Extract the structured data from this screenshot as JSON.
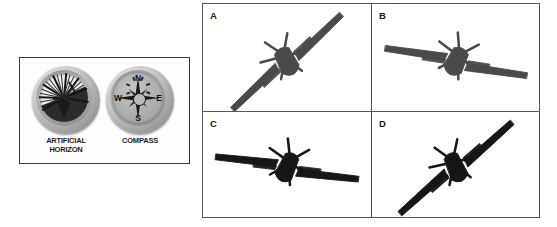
{
  "figure": {
    "type": "aviation-instruments-and-aircraft-attitude-figure",
    "background_color": "#ffffff"
  },
  "instrument_panel": {
    "border_color": "#3a3a3a",
    "instruments": [
      {
        "id": "artificial-horizon",
        "caption_line1": "ARTIFICIAL",
        "caption_line2": "HORIZON",
        "bezel_color": "#9d9d9d",
        "face_color": "#efefef",
        "ground_color": "#2b2b2b",
        "horizon_tilt_degrees": -24,
        "tick_count": 24
      },
      {
        "id": "compass",
        "caption_line1": "COMPASS",
        "caption_line2": "",
        "bezel_color": "#9d9d9d",
        "face_color": "#ababab",
        "cardinal_points": [
          "N",
          "E",
          "S",
          "W"
        ],
        "rose_points": 8
      }
    ]
  },
  "aircraft_grid": {
    "border_color": "#565656",
    "rows": 2,
    "columns": 2,
    "cells": [
      {
        "label": "A",
        "view": "front",
        "bank_direction": "right-wing-up",
        "bank_angle_degrees": -26,
        "silhouette_color": "#4a4a4a",
        "wingspan_px": 150
      },
      {
        "label": "B",
        "view": "front",
        "bank_direction": "left-wing-up",
        "bank_angle_degrees": 26,
        "silhouette_color": "#4a4a4a",
        "wingspan_px": 150
      },
      {
        "label": "C",
        "view": "rear",
        "bank_direction": "left-wing-up",
        "bank_angle_degrees": 24,
        "silhouette_color": "#161616",
        "wingspan_px": 150
      },
      {
        "label": "D",
        "view": "rear",
        "bank_direction": "right-wing-up",
        "bank_angle_degrees": -24,
        "silhouette_color": "#161616",
        "wingspan_px": 150
      }
    ]
  }
}
